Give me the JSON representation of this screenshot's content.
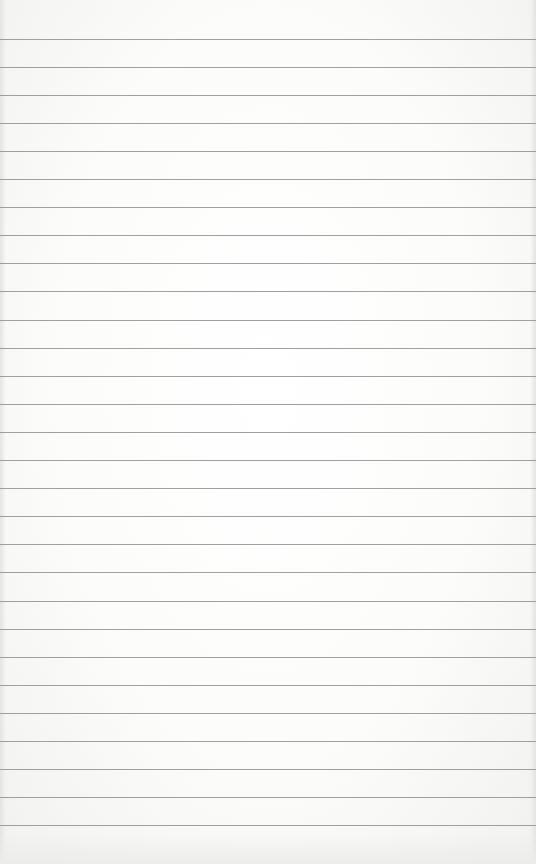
{
  "page": {
    "line_count": 29,
    "line_color": "#8f8f8f",
    "paper_color": "#fbfbfa"
  }
}
